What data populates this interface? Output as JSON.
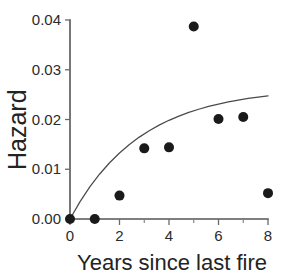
{
  "chart_data": {
    "type": "scatter",
    "title": "",
    "subtitle": "",
    "xlabel": "Years since last fire",
    "ylabel": "Hazard",
    "xlim": [
      0,
      8
    ],
    "ylim": [
      0,
      0.04
    ],
    "grid": false,
    "legend": "none",
    "xticks": [
      0,
      1,
      2,
      3,
      4,
      5,
      6,
      7,
      8
    ],
    "xtick_labels": [
      "0",
      "",
      "2",
      "",
      "4",
      "",
      "6",
      "",
      "8"
    ],
    "yticks": [
      0.0,
      0.01,
      0.02,
      0.03,
      0.04
    ],
    "ytick_labels": [
      "0.00",
      "0.01",
      "0.02",
      "0.03",
      "0.04"
    ],
    "series": [
      {
        "name": "observed hazard",
        "type": "scatter",
        "marker": "filled-circle",
        "color": "#1a1a1a",
        "x": [
          0,
          1,
          2,
          3,
          4,
          5,
          6,
          7,
          8
        ],
        "y": [
          0.0,
          0.0,
          0.0047,
          0.0142,
          0.0144,
          0.0387,
          0.0201,
          0.0205,
          0.0052
        ]
      },
      {
        "name": "fitted curve",
        "type": "line",
        "color": "#4a4a4a",
        "x": [
          0,
          0.4,
          0.8,
          1.2,
          1.6,
          2,
          2.4,
          2.8,
          3.2,
          3.6,
          4,
          4.4,
          4.8,
          5.2,
          5.6,
          6,
          6.4,
          6.8,
          7.2,
          7.6,
          8
        ],
        "y": [
          0.0,
          0.00345,
          0.00645,
          0.00905,
          0.01131,
          0.01327,
          0.01498,
          0.01646,
          0.01775,
          0.01886,
          0.01984,
          0.02068,
          0.02142,
          0.02206,
          0.02262,
          0.02311,
          0.02353,
          0.02391,
          0.02423,
          0.02452,
          0.02477
        ]
      }
    ],
    "marker_radius_px": 5,
    "axis_color": "#555555",
    "point_color": "#1a1a1a",
    "curve_color": "#4a4a4a",
    "background_color": "#ffffff"
  }
}
